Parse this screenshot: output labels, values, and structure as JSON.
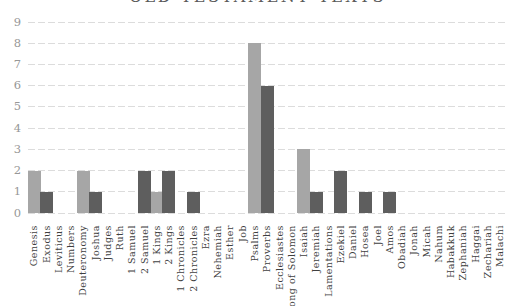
{
  "chart": {
    "title": "OLD TESTAMENT TEXTS",
    "title_clipped_at_top": true
  },
  "chart_data": {
    "type": "bar",
    "title": "OLD TESTAMENT TEXTS",
    "categories": [
      "Genesis",
      "Exodus",
      "Leviticus",
      "Numbers",
      "Deuteronomy",
      "Joshua",
      "Judges",
      "Ruth",
      "1 Samuel",
      "2 Samuel",
      "1 Kings",
      "2 Kings",
      "1 Chronicles",
      "2 Chronicles",
      "Ezra",
      "Nehemiah",
      "Esther",
      "Job",
      "Psalms",
      "Proverbs",
      "Ecclesiastes",
      "Song of Solomon",
      "Isaiah",
      "Jeremiah",
      "Lamentations",
      "Ezekiel",
      "Daniel",
      "Hosea",
      "Joel",
      "Amos",
      "Obadiah",
      "Jonah",
      "Micah",
      "Nahum",
      "Habakkuk",
      "Zephaniah",
      "Haggai",
      "Zechariah",
      "Malachi"
    ],
    "series": [
      {
        "name": "light-gray-series",
        "color": "#a6a6a6",
        "values": [
          2,
          0,
          0,
          0,
          2,
          0,
          0,
          0,
          0,
          0,
          1,
          0,
          0,
          0,
          0,
          0,
          0,
          0,
          8,
          0,
          0,
          0,
          3,
          0,
          0,
          0,
          0,
          0,
          0,
          0,
          0,
          0,
          0,
          0,
          0,
          0,
          0,
          0,
          0
        ]
      },
      {
        "name": "dark-gray-series",
        "color": "#5e5e5e",
        "values": [
          0,
          1,
          0,
          0,
          0,
          1,
          0,
          0,
          0,
          2,
          0,
          2,
          0,
          1,
          0,
          0,
          0,
          0,
          0,
          6,
          0,
          0,
          0,
          1,
          0,
          2,
          0,
          1,
          0,
          1,
          0,
          0,
          0,
          0,
          0,
          0,
          0,
          0,
          0
        ]
      }
    ],
    "xlabel": "",
    "ylabel": "",
    "ylim": [
      0,
      9
    ],
    "yticks": [
      0,
      1,
      2,
      3,
      4,
      5,
      6,
      7,
      8,
      9
    ],
    "grid": true,
    "gridline_color": "#dcdcdc",
    "y_tick_label_color": "#979797",
    "x_tick_label_color": "#3f3f3f",
    "title_color": "#595959",
    "legend_position": "none",
    "x_labels_rotation_degrees": -90
  }
}
